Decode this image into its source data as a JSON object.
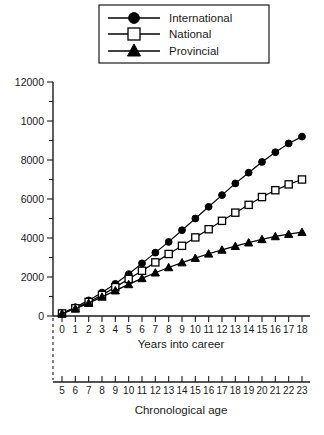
{
  "chart_data": {
    "type": "line",
    "title": "",
    "xlabel": "Years into career",
    "ylabel": "",
    "secondary_xlabel": "Chronological age",
    "x": [
      0,
      1,
      2,
      3,
      4,
      5,
      6,
      7,
      8,
      9,
      10,
      11,
      12,
      13,
      14,
      15,
      16,
      17,
      18
    ],
    "x_tick_labels": [
      "0",
      "1",
      "2",
      "3",
      "4",
      "5",
      "6",
      "7",
      "8",
      "9",
      "10",
      "11",
      "12",
      "13",
      "14",
      "15",
      "16",
      "17",
      "18"
    ],
    "secondary_x_tick_labels": [
      "5",
      "6",
      "7",
      "8",
      "9",
      "10",
      "11",
      "12",
      "13",
      "14",
      "15",
      "16",
      "17",
      "18",
      "19",
      "20",
      "21",
      "22",
      "23"
    ],
    "y_tick_labels": [
      "0",
      "2000",
      "4000",
      "6000",
      "8000",
      "1000",
      "12000"
    ],
    "y_tick_values": [
      0,
      2000,
      4000,
      6000,
      8000,
      10000,
      12000
    ],
    "ylim": [
      0,
      12000
    ],
    "xlim": [
      0,
      18
    ],
    "grid": false,
    "legend_position": "top-center",
    "series": [
      {
        "name": "International",
        "marker": "filled-circle",
        "values": [
          150,
          450,
          800,
          1200,
          1650,
          2150,
          2700,
          3250,
          3800,
          4400,
          5000,
          5600,
          6200,
          6800,
          7350,
          7900,
          8400,
          8850,
          9200
        ]
      },
      {
        "name": "National",
        "marker": "open-square",
        "values": [
          130,
          400,
          720,
          1080,
          1480,
          1900,
          2320,
          2750,
          3180,
          3600,
          4030,
          4450,
          4880,
          5300,
          5700,
          6100,
          6450,
          6750,
          7000
        ]
      },
      {
        "name": "Provincial",
        "marker": "filled-triangle",
        "values": [
          120,
          370,
          660,
          980,
          1300,
          1620,
          1930,
          2220,
          2490,
          2740,
          2970,
          3190,
          3390,
          3580,
          3760,
          3930,
          4080,
          4200,
          4300
        ]
      }
    ]
  },
  "legend": {
    "items": [
      {
        "label": "International",
        "marker": "filled-circle"
      },
      {
        "label": "National",
        "marker": "open-square"
      },
      {
        "label": "Provincial",
        "marker": "filled-triangle"
      }
    ]
  },
  "axes": {
    "primary_x_title": "Years into career",
    "secondary_x_title": "Chronological age"
  }
}
